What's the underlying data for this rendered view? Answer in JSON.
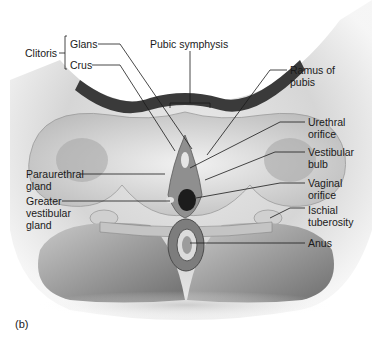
{
  "figure": {
    "panel_label": "(b)",
    "labels": {
      "clitoris": "Clitoris",
      "glans": "Glans",
      "crus": "Crus",
      "pubic_symphysis": "Pubic symphysis",
      "ramus_of_pubis": "Ramus of\npubis",
      "urethral_orifice": "Urethral\norifice",
      "vestibular_bulb": "Vestibular\nbulb",
      "vaginal_orifice": "Vaginal\norifice",
      "ischial_tuberosity": "Ischial\ntuberosity",
      "anus": "Anus",
      "paraurethral_gland": "Paraurethral\ngland",
      "greater_vestibular_gland": "Greater\nvestibular\ngland"
    }
  }
}
